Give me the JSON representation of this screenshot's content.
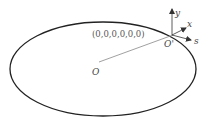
{
  "diagram": {
    "tuple_label": "(0,0,0,0,0,0)",
    "origin_label": "O",
    "local_origin_label": "O'",
    "axes": {
      "y": "y",
      "x": "x",
      "s": "s"
    },
    "colors": {
      "ellipse": "#222222",
      "line": "#888888",
      "text": "#444444"
    }
  }
}
